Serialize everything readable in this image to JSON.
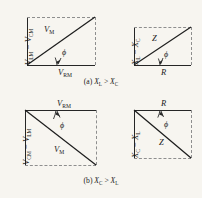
{
  "figure": {
    "rows": [
      {
        "id": "row-a",
        "caption_prefix": "(a)",
        "caption": "X_L > X_C",
        "caption_left": "X",
        "caption_left_sub": "L",
        "caption_rel": ">",
        "caption_right": "X",
        "caption_right_sub": "C",
        "panels": [
          {
            "id": "voltage-triangle-xl-gt-xc",
            "vertical_label": "V_LM − V_CM",
            "vertical_parts": {
              "a": "V",
              "a_sub": "LM",
              "op": "−",
              "b": "V",
              "b_sub": "CM"
            },
            "hypotenuse_label": "V",
            "hypotenuse_sub": "M",
            "horizontal_label": "V",
            "horizontal_sub": "RM",
            "angle_label": "ϕ",
            "direction": "ascending"
          },
          {
            "id": "impedance-triangle-xl-gt-xc",
            "vertical_label": "X_L − X_C",
            "vertical_parts": {
              "a": "X",
              "a_sub": "L",
              "op": "−",
              "b": "X",
              "b_sub": "C"
            },
            "hypotenuse_label": "Z",
            "hypotenuse_sub": "",
            "horizontal_label": "R",
            "horizontal_sub": "",
            "angle_label": "ϕ",
            "direction": "ascending"
          }
        ]
      },
      {
        "id": "row-b",
        "caption_prefix": "(b)",
        "caption": "X_C > X_L",
        "caption_left": "X",
        "caption_left_sub": "C",
        "caption_rel": ">",
        "caption_right": "X",
        "caption_right_sub": "L",
        "panels": [
          {
            "id": "voltage-triangle-xc-gt-xl",
            "vertical_label": "V_CM − V_LM",
            "vertical_parts": {
              "a": "V",
              "a_sub": "CM",
              "op": "−",
              "b": "V",
              "b_sub": "LM"
            },
            "hypotenuse_label": "V",
            "hypotenuse_sub": "M",
            "horizontal_label": "V",
            "horizontal_sub": "RM",
            "angle_label": "ϕ",
            "direction": "descending"
          },
          {
            "id": "impedance-triangle-xc-gt-xl",
            "vertical_label": "X_C − X_L",
            "vertical_parts": {
              "a": "X",
              "a_sub": "C",
              "op": "−",
              "b": "X",
              "b_sub": "L"
            },
            "hypotenuse_label": "Z",
            "hypotenuse_sub": "",
            "horizontal_label": "R",
            "horizontal_sub": "",
            "angle_label": "ϕ",
            "direction": "descending"
          }
        ]
      }
    ]
  },
  "colors": {
    "background": "#f7f5f0",
    "ink": "#1d1d1d",
    "dashed": "#8e8e8e"
  }
}
